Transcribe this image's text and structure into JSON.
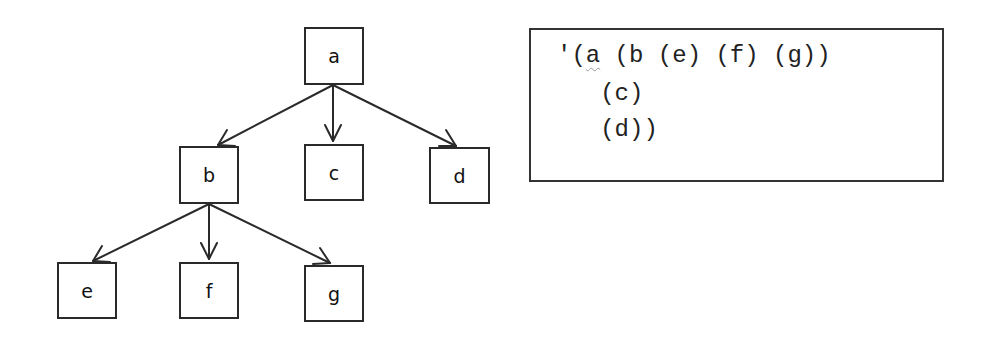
{
  "tree": {
    "nodes": [
      {
        "id": "a",
        "label": "a",
        "x": 304,
        "y": 27,
        "w": 60,
        "h": 58
      },
      {
        "id": "b",
        "label": "b",
        "x": 179,
        "y": 146,
        "w": 60,
        "h": 58
      },
      {
        "id": "c",
        "label": "c",
        "x": 304,
        "y": 144,
        "w": 60,
        "h": 57
      },
      {
        "id": "d",
        "label": "d",
        "x": 429,
        "y": 147,
        "w": 61,
        "h": 57
      },
      {
        "id": "e",
        "label": "e",
        "x": 57,
        "y": 262,
        "w": 60,
        "h": 57
      },
      {
        "id": "f",
        "label": "f",
        "x": 179,
        "y": 262,
        "w": 60,
        "h": 57
      },
      {
        "id": "g",
        "label": "g",
        "x": 304,
        "y": 265,
        "w": 60,
        "h": 57
      }
    ],
    "edges": [
      {
        "from": "a",
        "to": "b"
      },
      {
        "from": "a",
        "to": "c"
      },
      {
        "from": "a",
        "to": "d"
      },
      {
        "from": "b",
        "to": "e"
      },
      {
        "from": "b",
        "to": "f"
      },
      {
        "from": "b",
        "to": "g"
      }
    ]
  },
  "code": {
    "quote_prefix": "'(",
    "root_symbol": "a",
    "line1_rest": " (b (e) (f) (g))",
    "line2": "   (c)",
    "line3": "   (d))"
  }
}
